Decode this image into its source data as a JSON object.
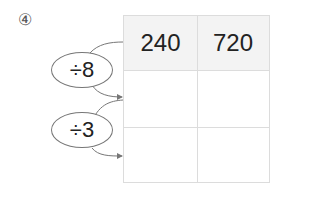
{
  "problem": {
    "number_label": "④"
  },
  "operators": [
    {
      "label": "÷8"
    },
    {
      "label": "÷3"
    }
  ],
  "table": {
    "rows": [
      [
        "240",
        "720"
      ],
      [
        "",
        ""
      ],
      [
        "",
        ""
      ]
    ]
  },
  "colors": {
    "header_bg": "#f3f3f3",
    "grid_line": "#dcdcdc",
    "arrow": "#777777"
  }
}
